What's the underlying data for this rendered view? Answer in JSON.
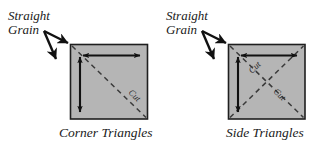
{
  "figure": {
    "background_color": "#ffffff",
    "patch_fill_color": "#b5b5b5",
    "patch_border_color": "#1f1f1f",
    "ink_color": "#111111",
    "dash_color": "#3a3a3a"
  },
  "panels": [
    {
      "id": "corner-triangles",
      "caption": "Corner Triangles",
      "grain_label_line1": "Straight",
      "grain_label_line2": "Grain",
      "cut_labels": [
        "Cut"
      ],
      "diagonals": 1,
      "grain_arrow_count": 2,
      "inner_arrows": [
        "horizontal",
        "vertical"
      ]
    },
    {
      "id": "side-triangles",
      "caption": "Side Triangles",
      "grain_label_line1": "Straight",
      "grain_label_line2": "Grain",
      "cut_labels": [
        "Cut",
        "Cut"
      ],
      "diagonals": 2,
      "grain_arrow_count": 2,
      "inner_arrows": [
        "horizontal",
        "vertical"
      ]
    }
  ]
}
